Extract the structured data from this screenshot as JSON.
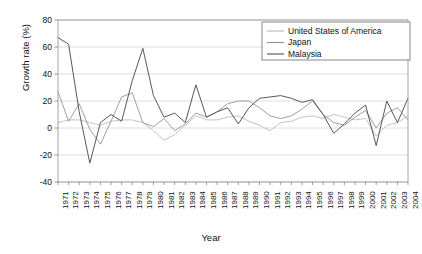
{
  "chart_data": {
    "type": "line",
    "title": "",
    "xlabel": "Year",
    "ylabel": "Growth rate (%)",
    "xlim": [
      1971,
      2004
    ],
    "ylim": [
      -40,
      80
    ],
    "yticks": [
      -40,
      -20,
      0,
      20,
      40,
      60,
      80
    ],
    "ytick_labels": [
      "-40",
      "-20",
      "0",
      "20",
      "40",
      "60",
      "80"
    ],
    "grid": true,
    "grid_axis": "y",
    "legend_position": "top-right",
    "x": [
      1971,
      1972,
      1973,
      1974,
      1975,
      1976,
      1977,
      1978,
      1979,
      1980,
      1981,
      1982,
      1983,
      1984,
      1985,
      1986,
      1987,
      1988,
      1989,
      1990,
      1991,
      1992,
      1993,
      1994,
      1995,
      1996,
      1997,
      1998,
      1999,
      2000,
      2001,
      2002,
      2003,
      2004
    ],
    "categories": [
      "1971",
      "1972",
      "1973",
      "1974",
      "1975",
      "1976",
      "1977",
      "1978",
      "1979",
      "1980",
      "1981",
      "1982",
      "1983",
      "1984",
      "1985",
      "1986",
      "1987",
      "1988",
      "1989",
      "1990",
      "1991",
      "1992",
      "1993",
      "1994",
      "1995",
      "1996",
      "1997",
      "1998",
      "1999",
      "2000",
      "2001",
      "2002",
      "2003",
      "2004"
    ],
    "series": [
      {
        "name": "United States of America",
        "color": "#b9b9b9",
        "values": [
          4,
          6,
          6,
          4,
          2,
          5,
          6,
          6,
          4,
          -2,
          -9,
          -5,
          2,
          9,
          6,
          6,
          8,
          9,
          5,
          2,
          -2,
          4,
          5,
          8,
          9,
          7,
          10,
          8,
          6,
          7,
          -6,
          2,
          4,
          9
        ]
      },
      {
        "name": "Japan",
        "color": "#8f8f8f",
        "values": [
          27,
          5,
          18,
          -1,
          -12,
          5,
          23,
          26,
          4,
          1,
          7,
          -2,
          3,
          11,
          8,
          12,
          18,
          20,
          20,
          15,
          9,
          7,
          9,
          14,
          20,
          10,
          4,
          2,
          8,
          13,
          0,
          11,
          15,
          6
        ]
      },
      {
        "name": "Malaysia",
        "color": "#4f4f4f",
        "values": [
          67,
          62,
          12,
          -26,
          4,
          10,
          5,
          35,
          59,
          24,
          8,
          11,
          4,
          32,
          8,
          12,
          15,
          3,
          15,
          22,
          23,
          24,
          22,
          19,
          21,
          10,
          -4,
          3,
          11,
          17,
          -13,
          20,
          4,
          22
        ]
      }
    ]
  },
  "legend": {
    "items": [
      {
        "label": "United States of America",
        "color": "#b9b9b9"
      },
      {
        "label": "Japan",
        "color": "#8f8f8f"
      },
      {
        "label": "Malaysia",
        "color": "#4f4f4f"
      }
    ]
  },
  "axes": {
    "y_title": "Growth rate (%)",
    "x_title": "Year"
  }
}
